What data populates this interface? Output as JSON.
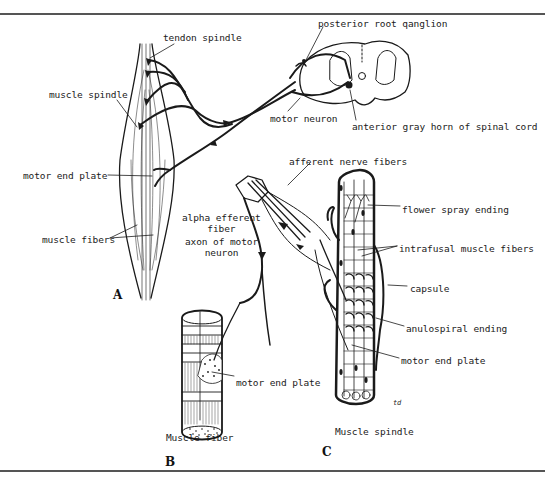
{
  "figure": {
    "rule_color": "#555555",
    "ink_color": "#1a1a1a",
    "panels": [
      {
        "id": "A",
        "label": "A",
        "x": 113,
        "y": 288
      },
      {
        "id": "B",
        "label": "B",
        "x": 165,
        "y": 455
      },
      {
        "id": "C",
        "label": "C",
        "x": 322,
        "y": 445
      }
    ],
    "labels": {
      "tendon_spindle": {
        "text": "tendon spindle",
        "x": 163,
        "y": 32
      },
      "muscle_spindle": {
        "text": "muscle spindle",
        "x": 49,
        "y": 89
      },
      "motor_end_plate_a": {
        "text": "motor end plate",
        "x": 23,
        "y": 170
      },
      "muscle_fibers": {
        "text": "muscle fibers",
        "x": 42,
        "y": 234
      },
      "posterior_root_ganglion": {
        "text": "posterior root qanglion",
        "x": 318,
        "y": 18
      },
      "motor_neuron": {
        "text": "motor neuron",
        "x": 270,
        "y": 113
      },
      "anterior_gray_horn": {
        "text": "anterior gray horn of spinal cord",
        "x": 352,
        "y": 121
      },
      "afferent_nerve_fibers": {
        "text": "afferent nerve fibers",
        "x": 289,
        "y": 156
      },
      "alpha_efferent_fiber": {
        "text": "alpha efferent\nfiber",
        "x": 182,
        "y": 212
      },
      "axon_of_motor_neuron": {
        "text": "axon of motor\nneuron",
        "x": 185,
        "y": 236
      },
      "flower_spray_ending": {
        "text": "flower spray ending",
        "x": 402,
        "y": 204
      },
      "intrafusal_muscle_fibers": {
        "text": "intrafusal muscle fibers",
        "x": 399,
        "y": 243
      },
      "capsule": {
        "text": "capsule",
        "x": 410,
        "y": 283
      },
      "anulospiral_ending": {
        "text": "anulospiral ending",
        "x": 406,
        "y": 323
      },
      "motor_end_plate_c": {
        "text": "motor end plate",
        "x": 401,
        "y": 355
      },
      "motor_end_plate_b": {
        "text": "motor end plate",
        "x": 236,
        "y": 377
      },
      "muscle_spindle_caption": {
        "text": "Muscle spindle",
        "x": 335,
        "y": 426
      },
      "muscle_fiber_caption": {
        "text": "Muscle fiber",
        "x": 166,
        "y": 432
      },
      "artist_initials": {
        "text": "td",
        "x": 393,
        "y": 398
      }
    }
  }
}
